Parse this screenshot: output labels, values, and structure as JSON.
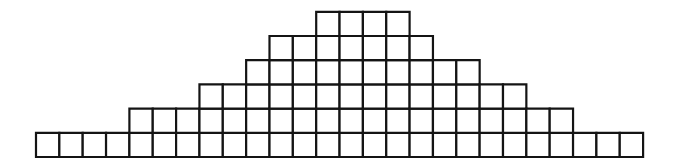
{
  "figure": {
    "name": "unit-square-histogram",
    "background_color": "#ffffff",
    "line_color": "#141414",
    "line_width_px": 2.2,
    "title": "",
    "subtitle": "",
    "caption": ""
  },
  "geometry": {
    "canvas_width": 676,
    "canvas_height": 166,
    "origin_x": 36,
    "baseline_y": 157,
    "cell_width": 23.35,
    "cell_height": 24.2,
    "columns": 26,
    "max_stack": 6
  },
  "chart_data": {
    "type": "bar",
    "title": "",
    "subtitle": "",
    "xlabel": "",
    "ylabel": "",
    "grid": false,
    "legend": null,
    "legend_position": "none",
    "annotations": [],
    "xlim": [
      0,
      26
    ],
    "ylim": [
      0,
      6
    ],
    "xtick_labels": [],
    "ytick_labels": [],
    "categories": [
      "1",
      "2",
      "3",
      "4",
      "5",
      "6",
      "7",
      "8",
      "9",
      "10",
      "11",
      "12",
      "13",
      "14",
      "15",
      "16",
      "17",
      "18",
      "19",
      "20",
      "21",
      "22",
      "23",
      "24",
      "25",
      "26"
    ],
    "values": [
      1,
      1,
      1,
      1,
      2,
      2,
      2,
      3,
      3,
      4,
      5,
      5,
      6,
      6,
      6,
      6,
      5,
      4,
      4,
      3,
      3,
      2,
      2,
      1,
      1,
      1
    ],
    "unit": "square",
    "total_squares": 76
  }
}
